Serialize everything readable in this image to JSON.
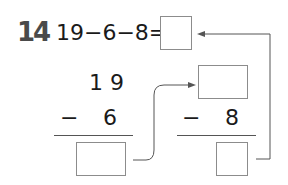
{
  "problem": {
    "number": "14",
    "expression": "19−6−8=",
    "step1": {
      "top": "1 9",
      "operator": "−",
      "subtrahend": "6"
    },
    "step2": {
      "operator": "−",
      "subtrahend": "8"
    },
    "colors": {
      "number": "#4a4a4a",
      "text": "#1a1a1a",
      "box_border": "#8c8c8c",
      "arrow": "#555555"
    }
  }
}
